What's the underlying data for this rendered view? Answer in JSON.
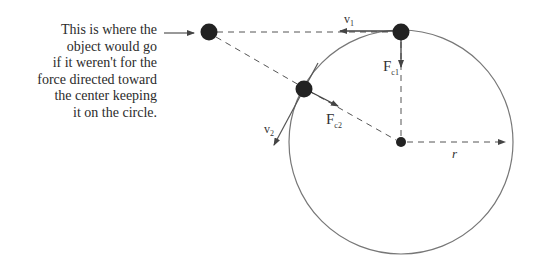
{
  "caption": {
    "lines": [
      "This is where the",
      "object would go",
      "if it weren't for the",
      "force directed toward",
      "the center keeping",
      "it on the circle."
    ]
  },
  "labels": {
    "v1": "v",
    "v1_sub": "1",
    "fc1": "F",
    "fc1_sub": "c1",
    "v2": "v",
    "v2_sub": "2",
    "fc2": "F",
    "fc2_sub": "c2",
    "r": "r"
  },
  "colors": {
    "ink": "#222222",
    "line": "#555555",
    "circle": "#777777"
  }
}
